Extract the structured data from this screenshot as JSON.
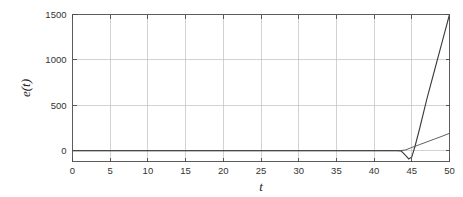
{
  "chart_data": {
    "type": "line",
    "title": "",
    "subtitle": "",
    "xlabel": "t",
    "ylabel": "e(t)",
    "xlim": [
      0,
      50
    ],
    "ylim": [
      -120,
      1500
    ],
    "grid": true,
    "legend": null,
    "legend_position": "none",
    "xticks": [
      0,
      5,
      10,
      15,
      20,
      25,
      30,
      35,
      40,
      45,
      50
    ],
    "xticklabels": [
      "0",
      "5",
      "10",
      "15",
      "20",
      "25",
      "30",
      "35",
      "40",
      "45",
      "50"
    ],
    "yticks": [
      0,
      500,
      1000,
      1500
    ],
    "yticklabels": [
      "0",
      "500",
      "1000",
      "1500"
    ],
    "series": [
      {
        "name": "e1",
        "color": "#3a3a3a",
        "x": [
          0,
          5,
          10,
          15,
          20,
          25,
          30,
          35,
          40,
          42,
          43,
          43.6,
          44.2,
          44.6,
          45,
          45.4,
          46,
          47,
          48,
          49,
          50
        ],
        "y": [
          0,
          0,
          0,
          0,
          0,
          0,
          0,
          0,
          0,
          0,
          0,
          -5,
          -55,
          -92,
          -70,
          40,
          230,
          570,
          880,
          1190,
          1500
        ]
      },
      {
        "name": "e2",
        "color": "#4d4d4d",
        "x": [
          0,
          10,
          20,
          30,
          40,
          42,
          43.5,
          44.2,
          45,
          46,
          47,
          48,
          49,
          50
        ],
        "y": [
          0,
          0,
          0,
          0,
          0,
          0,
          0,
          8,
          35,
          65,
          96,
          127,
          158,
          190
        ]
      }
    ],
    "annotations": []
  },
  "axis_labels": {
    "x_title": "t",
    "y_title": "e(t)"
  }
}
